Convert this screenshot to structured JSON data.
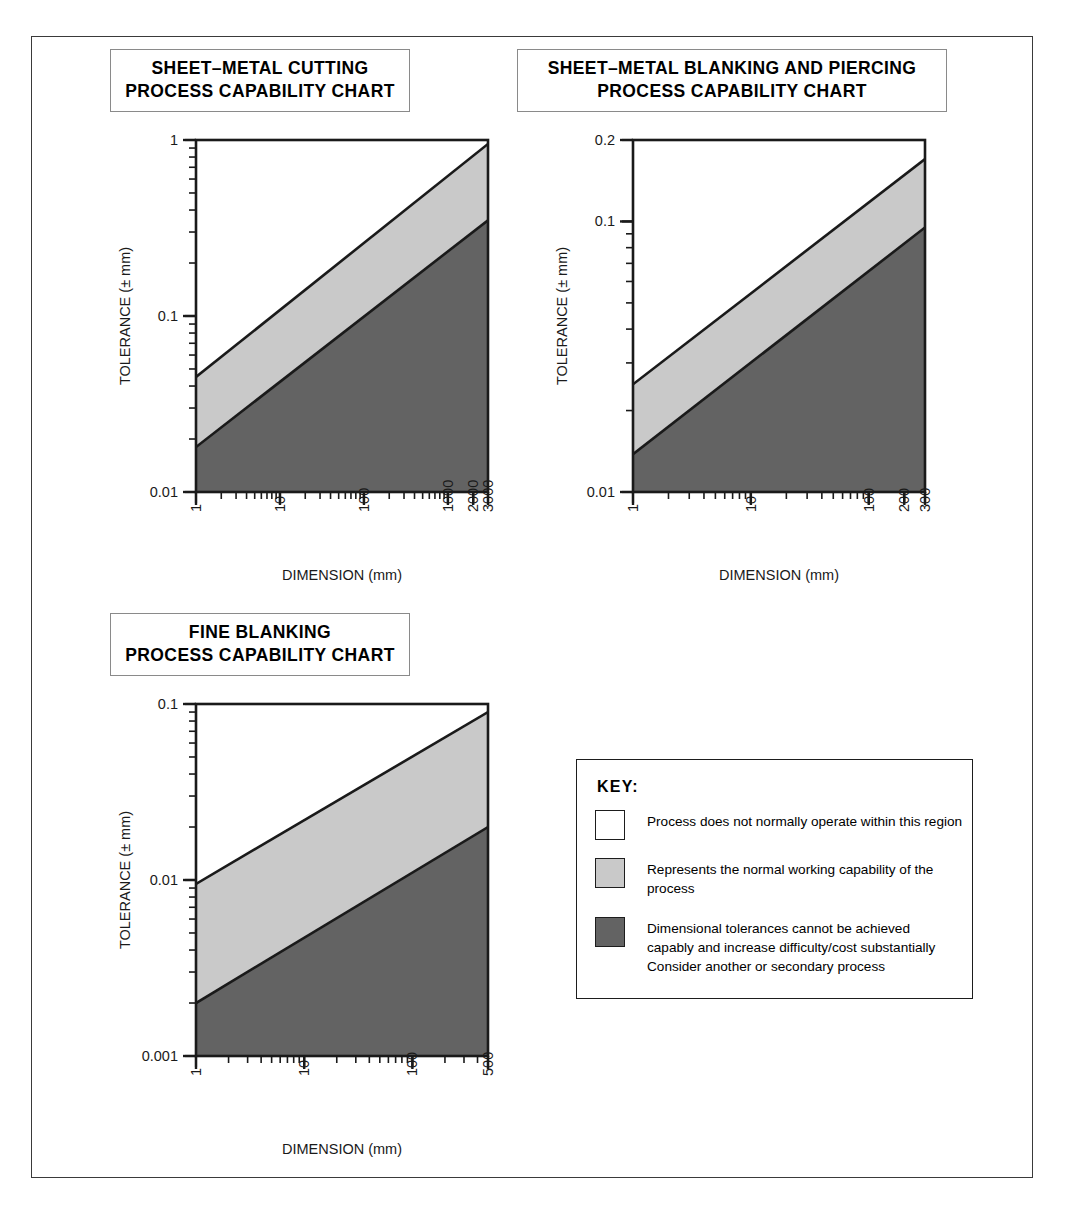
{
  "caption_fragment": " ",
  "charts": [
    {
      "id": "sheet-metal-cutting",
      "title_line1": "SHEET–METAL CUTTING",
      "title_line2": "PROCESS CAPABILITY CHART",
      "xlabel": "DIMENSION (mm)",
      "ylabel": "TOLERANCE (± mm)",
      "xticks": [
        "1",
        "10",
        "100",
        "1000",
        "2000",
        "3000"
      ],
      "xtick_values": [
        1,
        10,
        100,
        1000,
        2000,
        3000
      ],
      "yticks": [
        "1",
        "0.1",
        "0.01"
      ],
      "ytick_values": [
        1,
        0.1,
        0.01
      ],
      "xlim": [
        1,
        3000
      ],
      "ylim": [
        0.01,
        1
      ]
    },
    {
      "id": "sheet-metal-blanking-piercing",
      "title_line1": "SHEET–METAL BLANKING AND PIERCING",
      "title_line2": "PROCESS CAPABILITY CHART",
      "xlabel": "DIMENSION (mm)",
      "ylabel": "TOLERANCE (± mm)",
      "xticks": [
        "1",
        "10",
        "100",
        "200",
        "300"
      ],
      "xtick_values": [
        1,
        10,
        100,
        200,
        300
      ],
      "yticks": [
        "0.2",
        "0.1",
        "0.01"
      ],
      "ytick_values": [
        0.2,
        0.1,
        0.01
      ],
      "xlim": [
        1,
        300
      ],
      "ylim": [
        0.01,
        0.2
      ]
    },
    {
      "id": "fine-blanking",
      "title_line1": "FINE BLANKING",
      "title_line2": "PROCESS CAPABILITY CHART",
      "xlabel": "DIMENSION (mm)",
      "ylabel": "TOLERANCE (± mm)",
      "xticks": [
        "1",
        "10",
        "100",
        "500"
      ],
      "xtick_values": [
        1,
        10,
        100,
        500
      ],
      "yticks": [
        "0.1",
        "0.01",
        "0.001"
      ],
      "ytick_values": [
        0.1,
        0.01,
        0.001
      ],
      "xlim": [
        1,
        500
      ],
      "ylim": [
        0.001,
        0.1
      ]
    }
  ],
  "key": {
    "title": "KEY:",
    "entries": [
      {
        "swatch": "white",
        "lines": [
          "Process does not normally operate within this region"
        ]
      },
      {
        "swatch": "light",
        "lines": [
          "Represents the normal working capability of the",
          "process"
        ]
      },
      {
        "swatch": "dark",
        "lines": [
          "Dimensional tolerances cannot be achieved",
          "capably and increase difficulty/cost substantially",
          "Consider another or secondary process"
        ]
      }
    ]
  },
  "colors": {
    "light_band": "#c9c9c9",
    "dark_band": "#636363",
    "white_band": "#ffffff",
    "line": "#1a1a1a",
    "frame": "#3a3a3a"
  },
  "chart_data": [
    {
      "type": "area",
      "title": "SHEET–METAL CUTTING PROCESS CAPABILITY CHART",
      "xlabel": "DIMENSION (mm)",
      "ylabel": "TOLERANCE (± mm)",
      "xscale": "log",
      "yscale": "log",
      "xlim": [
        1,
        3000
      ],
      "ylim": [
        0.01,
        1
      ],
      "grid": false,
      "legend": "KEY box at lower right of figure",
      "series": [
        {
          "name": "upper boundary (normal capability top)",
          "x": [
            1,
            3000
          ],
          "y": [
            0.045,
            0.95
          ]
        },
        {
          "name": "lower boundary (normal capability bottom)",
          "x": [
            1,
            3000
          ],
          "y": [
            0.018,
            0.35
          ]
        }
      ],
      "regions": [
        {
          "name": "process does not normally operate",
          "fill": "#ffffff",
          "above": "upper boundary (normal capability top)"
        },
        {
          "name": "normal working capability",
          "fill": "#c9c9c9",
          "between": [
            "upper boundary (normal capability top)",
            "lower boundary (normal capability bottom)"
          ]
        },
        {
          "name": "not capably achievable",
          "fill": "#636363",
          "below": "lower boundary (normal capability bottom)"
        }
      ]
    },
    {
      "type": "area",
      "title": "SHEET–METAL BLANKING AND PIERCING PROCESS CAPABILITY CHART",
      "xlabel": "DIMENSION (mm)",
      "ylabel": "TOLERANCE (± mm)",
      "xscale": "log",
      "yscale": "log",
      "xlim": [
        1,
        300
      ],
      "ylim": [
        0.01,
        0.2
      ],
      "grid": false,
      "series": [
        {
          "name": "upper boundary (normal capability top)",
          "x": [
            1,
            300
          ],
          "y": [
            0.025,
            0.17
          ]
        },
        {
          "name": "lower boundary (normal capability bottom)",
          "x": [
            1,
            300
          ],
          "y": [
            0.0138,
            0.095
          ]
        }
      ],
      "regions": [
        {
          "name": "process does not normally operate",
          "fill": "#ffffff",
          "above": "upper boundary (normal capability top)"
        },
        {
          "name": "normal working capability",
          "fill": "#c9c9c9",
          "between": [
            "upper boundary (normal capability top)",
            "lower boundary (normal capability bottom)"
          ]
        },
        {
          "name": "not capably achievable",
          "fill": "#636363",
          "below": "lower boundary (normal capability bottom)"
        }
      ]
    },
    {
      "type": "area",
      "title": "FINE BLANKING PROCESS CAPABILITY CHART",
      "xlabel": "DIMENSION (mm)",
      "ylabel": "TOLERANCE (± mm)",
      "xscale": "log",
      "yscale": "log",
      "xlim": [
        1,
        500
      ],
      "ylim": [
        0.001,
        0.1
      ],
      "grid": false,
      "series": [
        {
          "name": "upper boundary (normal capability top)",
          "x": [
            1,
            500
          ],
          "y": [
            0.0095,
            0.09
          ]
        },
        {
          "name": "lower boundary (normal capability bottom)",
          "x": [
            1,
            500
          ],
          "y": [
            0.002,
            0.02
          ]
        }
      ],
      "regions": [
        {
          "name": "process does not normally operate",
          "fill": "#ffffff",
          "above": "upper boundary (normal capability top)"
        },
        {
          "name": "normal working capability",
          "fill": "#c9c9c9",
          "between": [
            "upper boundary (normal capability top)",
            "lower boundary (normal capability bottom)"
          ]
        },
        {
          "name": "not capably achievable",
          "fill": "#636363",
          "below": "lower boundary (normal capability bottom)"
        }
      ]
    }
  ]
}
